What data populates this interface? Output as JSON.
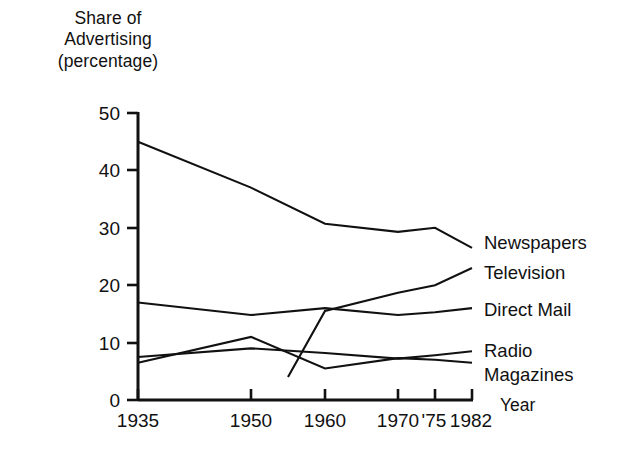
{
  "chart_data": {
    "type": "line",
    "title": "",
    "ylabel": "Share of\nAdvertising\n(percentage)",
    "xlabel": "Year",
    "x": [
      1935,
      1950,
      1960,
      1970,
      1975,
      1982
    ],
    "xtick_labels": [
      "1935",
      "1950",
      "1960",
      "1970",
      "'75",
      "1982"
    ],
    "ytick_labels": [
      "0",
      "10",
      "20",
      "30",
      "40",
      "50"
    ],
    "ytick_values": [
      0,
      10,
      20,
      30,
      40,
      50
    ],
    "ylim": [
      0,
      50
    ],
    "xlim": [
      1935,
      1982
    ],
    "grid": false,
    "legend_position": "right-of-line-ends",
    "series": [
      {
        "name": "Newspapers",
        "x": [
          1935,
          1950,
          1960,
          1970,
          1975,
          1982
        ],
        "values": [
          45,
          37,
          30.7,
          29.3,
          30,
          26.5
        ]
      },
      {
        "name": "Television",
        "x": [
          1955,
          1960,
          1970,
          1975,
          1982
        ],
        "values": [
          4,
          15.5,
          18.7,
          20,
          23
        ]
      },
      {
        "name": "Direct Mail",
        "x": [
          1935,
          1950,
          1960,
          1970,
          1975,
          1982
        ],
        "values": [
          17,
          14.8,
          16,
          14.8,
          15.3,
          16
        ]
      },
      {
        "name": "Radio",
        "x": [
          1935,
          1950,
          1960,
          1970,
          1975,
          1982
        ],
        "values": [
          7.5,
          9,
          8.2,
          7.2,
          7.8,
          8.5
        ]
      },
      {
        "name": "Magazines",
        "x": [
          1935,
          1950,
          1960,
          1970,
          1975,
          1982
        ],
        "values": [
          6.5,
          11,
          5.5,
          7.3,
          7,
          6.5
        ]
      }
    ]
  },
  "labels": {
    "y_axis_title": "Share of\nAdvertising\n(percentage)",
    "x_axis_title": "Year",
    "ytick_50": "50",
    "ytick_40": "40",
    "ytick_30": "30",
    "ytick_20": "20",
    "ytick_10": "10",
    "ytick_0": "0",
    "xtick_1935": "1935",
    "xtick_1950": "1950",
    "xtick_1960": "1960",
    "xtick_1970": "1970",
    "xtick_1975": "'75",
    "xtick_1982": "1982",
    "series_newspapers": "Newspapers",
    "series_television": "Television",
    "series_direct_mail": "Direct Mail",
    "series_radio": "Radio",
    "series_magazines": "Magazines"
  },
  "style": {
    "line_color": "#111111",
    "background": "#ffffff"
  }
}
